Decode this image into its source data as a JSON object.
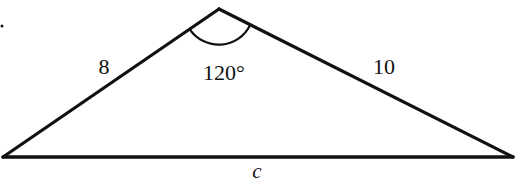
{
  "figure": {
    "type": "triangle",
    "stroke_color": "#111111",
    "background": "#ffffff",
    "vertices": {
      "apex": [
        219,
        9
      ],
      "left": [
        3,
        157
      ],
      "right": [
        513,
        157
      ]
    },
    "sides": {
      "left_side": {
        "label": "8"
      },
      "right_side": {
        "label": "10"
      },
      "base": {
        "label": "c"
      }
    },
    "angle": {
      "vertex": "apex",
      "label": "120°",
      "arc_radius": 35
    },
    "stray_mark": {
      "glyph": ".",
      "position": [
        2,
        26
      ]
    }
  }
}
